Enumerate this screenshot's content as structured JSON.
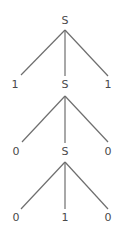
{
  "diagram": {
    "type": "parse-tree",
    "colors": {
      "edge": "#6e6e6e",
      "text": "#4a4a4a",
      "background": "#ffffff"
    },
    "nodes": [
      {
        "id": "n0",
        "label": "S",
        "x": 65,
        "y": 24
      },
      {
        "id": "n1",
        "label": "1",
        "x": 15,
        "y": 88
      },
      {
        "id": "n2",
        "label": "S",
        "x": 65,
        "y": 88
      },
      {
        "id": "n3",
        "label": "1",
        "x": 108,
        "y": 88
      },
      {
        "id": "n4",
        "label": "0",
        "x": 16,
        "y": 155
      },
      {
        "id": "n5",
        "label": "S",
        "x": 65,
        "y": 155
      },
      {
        "id": "n6",
        "label": "0",
        "x": 108,
        "y": 155
      },
      {
        "id": "n7",
        "label": "0",
        "x": 16,
        "y": 221
      },
      {
        "id": "n8",
        "label": "1",
        "x": 65,
        "y": 221
      },
      {
        "id": "n9",
        "label": "0",
        "x": 108,
        "y": 221
      }
    ],
    "edges": [
      {
        "from": "n0",
        "to": "n1"
      },
      {
        "from": "n0",
        "to": "n2"
      },
      {
        "from": "n0",
        "to": "n3"
      },
      {
        "from": "n2",
        "to": "n4"
      },
      {
        "from": "n2",
        "to": "n5"
      },
      {
        "from": "n2",
        "to": "n6"
      },
      {
        "from": "n5",
        "to": "n7"
      },
      {
        "from": "n5",
        "to": "n8"
      },
      {
        "from": "n5",
        "to": "n9"
      }
    ]
  }
}
